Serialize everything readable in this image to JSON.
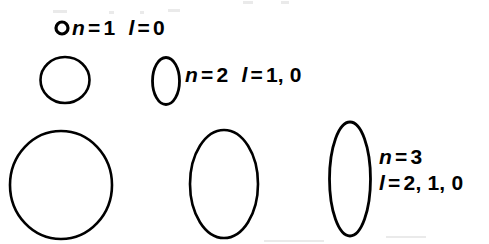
{
  "figure": {
    "background_color": "#ffffff",
    "stroke_color": "#000000",
    "width": 489,
    "height": 244
  },
  "rows": [
    {
      "id": "n1",
      "n_label": "n",
      "n_equals": "=",
      "n_value": "1",
      "l_label": "l",
      "l_equals": "=",
      "l_values": "0",
      "shape_count": 1
    },
    {
      "id": "n2",
      "n_label": "n",
      "n_equals": "=",
      "n_value": "2",
      "l_label": "l",
      "l_equals": "=",
      "l_values": "1, 0",
      "shape_count": 2
    },
    {
      "id": "n3",
      "n_label": "n",
      "n_equals": "=",
      "n_value": "3",
      "l_label": "l",
      "l_equals": "=",
      "l_values": "2, 1, 0",
      "shape_count": 3
    }
  ],
  "orbits": [
    {
      "name": "orbit-n1-circle",
      "row": "n1",
      "shape": "circle",
      "cx": 62,
      "cy": 28,
      "rx": 6.0,
      "ry": 6.0,
      "stroke_width": 3.2,
      "rotation": 0
    },
    {
      "name": "orbit-n2-circle",
      "row": "n2",
      "shape": "circle",
      "cx": 65,
      "cy": 80,
      "rx": 24.5,
      "ry": 23.0,
      "stroke_width": 2.6,
      "rotation": 0
    },
    {
      "name": "orbit-n2-ellipse",
      "row": "n2",
      "shape": "ellipse",
      "cx": 166,
      "cy": 81,
      "rx": 13.5,
      "ry": 23.5,
      "stroke_width": 2.8,
      "rotation": 0
    },
    {
      "name": "orbit-n3-circle",
      "row": "n3",
      "shape": "circle",
      "cx": 61,
      "cy": 185,
      "rx": 51.0,
      "ry": 54.0,
      "stroke_width": 2.6,
      "rotation": 0
    },
    {
      "name": "orbit-n3-ellipse-wide",
      "row": "n3",
      "shape": "ellipse",
      "cx": 224,
      "cy": 184,
      "rx": 34.0,
      "ry": 54.0,
      "stroke_width": 2.6,
      "rotation": 0
    },
    {
      "name": "orbit-n3-ellipse-narrow",
      "row": "n3",
      "shape": "ellipse",
      "cx": 350,
      "cy": 179,
      "rx": 20.5,
      "ry": 57.0,
      "stroke_width": 2.8,
      "rotation": 0
    }
  ],
  "artifacts": [
    {
      "x": 53,
      "y": 10,
      "w": 14,
      "h": 3
    },
    {
      "x": 109,
      "y": 11,
      "w": 5,
      "h": 3
    },
    {
      "x": 140,
      "y": 11,
      "w": 4,
      "h": 3
    },
    {
      "x": 168,
      "y": 9,
      "w": 12,
      "h": 3
    },
    {
      "x": 243,
      "y": 1,
      "w": 10,
      "h": 3
    },
    {
      "x": 281,
      "y": 1,
      "w": 8,
      "h": 3
    },
    {
      "x": 264,
      "y": 240,
      "w": 60,
      "h": 2
    },
    {
      "x": 386,
      "y": 236,
      "w": 40,
      "h": 2
    }
  ]
}
